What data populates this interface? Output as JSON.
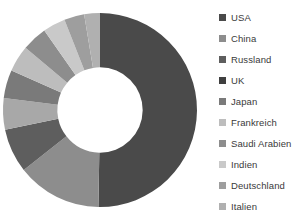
{
  "chart_data": {
    "type": "pie",
    "variant": "donut",
    "title": "",
    "subtitle": "",
    "xlabel": "",
    "ylabel": "",
    "grid": false,
    "legend_position": "right",
    "hole_ratio": 0.44,
    "start_angle_deg": 0,
    "direction": "clockwise",
    "categories": [
      "USA",
      "China",
      "Russland",
      "UK",
      "Japan",
      "Frankreich",
      "Saudi Arabien",
      "Indien",
      "Deutschland",
      "Italien"
    ],
    "values": [
      48.0,
      13.5,
      7.0,
      5.0,
      4.5,
      4.2,
      4.0,
      3.6,
      3.2,
      2.5
    ],
    "colors": [
      "#4a4a4a",
      "#8d8d8d",
      "#5e5e5e",
      "#a8a8a8",
      "#7a7a7a",
      "#bdbdbd",
      "#8d8d8d",
      "#c9c9c9",
      "#9e9e9e",
      "#b0b0b0"
    ]
  },
  "legend": {
    "items": [
      {
        "label": "USA",
        "color": "#4a4a4a"
      },
      {
        "label": "China",
        "color": "#8d8d8d"
      },
      {
        "label": "Russland",
        "color": "#5e5e5e"
      },
      {
        "label": "UK",
        "color": "#3f3f3f"
      },
      {
        "label": "Japan",
        "color": "#7a7a7a"
      },
      {
        "label": "Frankreich",
        "color": "#bdbdbd"
      },
      {
        "label": "Saudi Arabien",
        "color": "#8d8d8d"
      },
      {
        "label": "Indien",
        "color": "#c9c9c9"
      },
      {
        "label": "Deutschland",
        "color": "#9e9e9e"
      },
      {
        "label": "Italien",
        "color": "#b0b0b0"
      }
    ]
  }
}
